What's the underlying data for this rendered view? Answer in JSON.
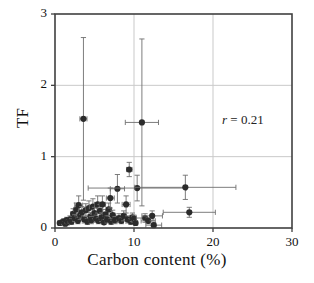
{
  "chart_data": {
    "type": "scatter",
    "title": "",
    "xlabel": "Carbon content (%)",
    "ylabel": "TF",
    "xlim": [
      0,
      30
    ],
    "ylim": [
      0,
      3
    ],
    "xticks": [
      0,
      10,
      20,
      30
    ],
    "yticks": [
      0,
      1,
      2,
      3
    ],
    "xticklabels": [
      "0",
      "10",
      "20",
      "30"
    ],
    "yticklabels": [
      "0",
      "1",
      "2",
      "3"
    ],
    "grid": true,
    "grid_color": "#c9c9c9",
    "legend": "none",
    "marker_color": "#2b2b2b",
    "errorbar_color": "#6e6e6e",
    "annotations": [
      {
        "name": "correlation",
        "symbol": "r",
        "equals": "=",
        "value": "0.21",
        "text": "r = 0.21",
        "x": 23.5,
        "y": 1.28
      }
    ],
    "points": [
      {
        "x": 0.6,
        "y": 0.07,
        "xerr": 0.15,
        "yerr": 0.03
      },
      {
        "x": 0.9,
        "y": 0.08,
        "xerr": 0.2,
        "yerr": 0.03
      },
      {
        "x": 1.1,
        "y": 0.09,
        "xerr": 0.2,
        "yerr": 0.04
      },
      {
        "x": 1.3,
        "y": 0.06,
        "xerr": 0.2,
        "yerr": 0.03
      },
      {
        "x": 1.5,
        "y": 0.11,
        "xerr": 0.25,
        "yerr": 0.04
      },
      {
        "x": 1.7,
        "y": 0.08,
        "xerr": 0.2,
        "yerr": 0.03
      },
      {
        "x": 1.9,
        "y": 0.12,
        "xerr": 0.25,
        "yerr": 0.05
      },
      {
        "x": 2.1,
        "y": 0.09,
        "xerr": 0.2,
        "yerr": 0.04
      },
      {
        "x": 2.3,
        "y": 0.2,
        "xerr": 0.3,
        "yerr": 0.07
      },
      {
        "x": 2.5,
        "y": 0.14,
        "xerr": 0.25,
        "yerr": 0.05
      },
      {
        "x": 2.7,
        "y": 0.26,
        "xerr": 0.3,
        "yerr": 0.09
      },
      {
        "x": 2.9,
        "y": 0.1,
        "xerr": 0.2,
        "yerr": 0.04
      },
      {
        "x": 3.0,
        "y": 0.32,
        "xerr": 0.5,
        "yerr": 0.13
      },
      {
        "x": 3.2,
        "y": 0.18,
        "xerr": 0.3,
        "yerr": 0.06
      },
      {
        "x": 3.4,
        "y": 0.22,
        "xerr": 0.3,
        "yerr": 0.08
      },
      {
        "x": 3.6,
        "y": 1.53,
        "xerr": 0.45,
        "yerr": 1.14
      },
      {
        "x": 3.7,
        "y": 0.12,
        "xerr": 0.25,
        "yerr": 0.05
      },
      {
        "x": 3.9,
        "y": 0.25,
        "xerr": 0.3,
        "yerr": 0.09
      },
      {
        "x": 4.1,
        "y": 0.09,
        "xerr": 0.2,
        "yerr": 0.04
      },
      {
        "x": 4.3,
        "y": 0.28,
        "xerr": 0.4,
        "yerr": 0.1
      },
      {
        "x": 4.5,
        "y": 0.16,
        "xerr": 0.3,
        "yerr": 0.06
      },
      {
        "x": 4.6,
        "y": 0.11,
        "xerr": 0.25,
        "yerr": 0.05
      },
      {
        "x": 4.8,
        "y": 0.3,
        "xerr": 0.45,
        "yerr": 0.11
      },
      {
        "x": 5.0,
        "y": 0.21,
        "xerr": 0.3,
        "yerr": 0.08
      },
      {
        "x": 5.2,
        "y": 0.13,
        "xerr": 0.25,
        "yerr": 0.05
      },
      {
        "x": 5.4,
        "y": 0.33,
        "xerr": 0.4,
        "yerr": 0.12
      },
      {
        "x": 5.5,
        "y": 0.1,
        "xerr": 0.2,
        "yerr": 0.04
      },
      {
        "x": 5.7,
        "y": 0.24,
        "xerr": 0.35,
        "yerr": 0.09
      },
      {
        "x": 5.9,
        "y": 0.15,
        "xerr": 0.3,
        "yerr": 0.06
      },
      {
        "x": 6.0,
        "y": 0.33,
        "xerr": 0.4,
        "yerr": 0.12
      },
      {
        "x": 6.2,
        "y": 0.08,
        "xerr": 0.2,
        "yerr": 0.03
      },
      {
        "x": 6.4,
        "y": 0.19,
        "xerr": 0.3,
        "yerr": 0.07
      },
      {
        "x": 6.6,
        "y": 0.12,
        "xerr": 0.25,
        "yerr": 0.05
      },
      {
        "x": 6.8,
        "y": 0.26,
        "xerr": 0.35,
        "yerr": 0.09
      },
      {
        "x": 7.0,
        "y": 0.42,
        "xerr": 0.5,
        "yerr": 0.14
      },
      {
        "x": 7.1,
        "y": 0.09,
        "xerr": 0.2,
        "yerr": 0.04
      },
      {
        "x": 7.3,
        "y": 0.18,
        "xerr": 0.3,
        "yerr": 0.07
      },
      {
        "x": 7.6,
        "y": 0.11,
        "xerr": 0.25,
        "yerr": 0.05
      },
      {
        "x": 7.9,
        "y": 0.55,
        "xerr": 0.9,
        "yerr": 0.2
      },
      {
        "x": 8.1,
        "y": 0.14,
        "xerr": 0.3,
        "yerr": 0.06
      },
      {
        "x": 8.4,
        "y": 0.1,
        "xerr": 0.25,
        "yerr": 0.04
      },
      {
        "x": 8.7,
        "y": 0.17,
        "xerr": 0.3,
        "yerr": 0.07
      },
      {
        "x": 9.0,
        "y": 0.33,
        "xerr": 0.5,
        "yerr": 0.12
      },
      {
        "x": 9.2,
        "y": 0.12,
        "xerr": 0.25,
        "yerr": 0.05
      },
      {
        "x": 9.4,
        "y": 0.82,
        "xerr": 0.35,
        "yerr": 0.1
      },
      {
        "x": 9.6,
        "y": 0.09,
        "xerr": 0.2,
        "yerr": 0.04
      },
      {
        "x": 9.8,
        "y": 0.15,
        "xerr": 0.3,
        "yerr": 0.06
      },
      {
        "x": 10.0,
        "y": 0.13,
        "xerr": 0.3,
        "yerr": 0.05
      },
      {
        "x": 10.2,
        "y": 0.07,
        "xerr": 0.25,
        "yerr": 0.03
      },
      {
        "x": 10.4,
        "y": 0.56,
        "xerr": 6.2,
        "yerr": 0.18
      },
      {
        "x": 11.0,
        "y": 1.48,
        "xerr": 2.1,
        "yerr": 1.17
      },
      {
        "x": 11.4,
        "y": 0.14,
        "xerr": 1.1,
        "yerr": 0.06
      },
      {
        "x": 11.8,
        "y": 0.1,
        "xerr": 0.9,
        "yerr": 0.04
      },
      {
        "x": 12.3,
        "y": 0.17,
        "xerr": 1.3,
        "yerr": 0.07
      },
      {
        "x": 12.5,
        "y": 0.04,
        "xerr": 1.0,
        "yerr": 0.03
      },
      {
        "x": 16.5,
        "y": 0.57,
        "xerr": 6.4,
        "yerr": 0.17
      },
      {
        "x": 17.0,
        "y": 0.22,
        "xerr": 3.3,
        "yerr": 0.07
      }
    ]
  }
}
